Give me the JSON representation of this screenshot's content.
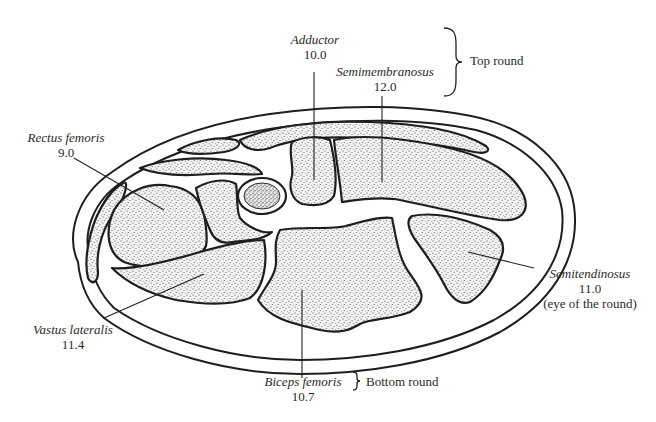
{
  "figure": {
    "muscles": [
      {
        "id": "adductor",
        "name": "Adductor",
        "value": "10.0",
        "group": "top_round"
      },
      {
        "id": "semimembranosus",
        "name": "Semimembranosus",
        "value": "12.0",
        "group": "top_round"
      },
      {
        "id": "rectus-femoris",
        "name": "Rectus femoris",
        "value": "9.0"
      },
      {
        "id": "vastus-lateralis",
        "name": "Vastus lateralis",
        "value": "11.4"
      },
      {
        "id": "semitendinosus",
        "name": "Semitendinosus",
        "value": "11.0",
        "note": "(eye of the round)"
      },
      {
        "id": "biceps-femoris",
        "name": "Biceps femoris",
        "value": "10.7",
        "group": "bottom_round"
      }
    ],
    "groups": {
      "top_round": "Top round",
      "bottom_round": "Bottom round"
    },
    "colors": {
      "ink": "#1e1e1e",
      "text": "#2a2a2a",
      "background": "#ffffff"
    }
  }
}
